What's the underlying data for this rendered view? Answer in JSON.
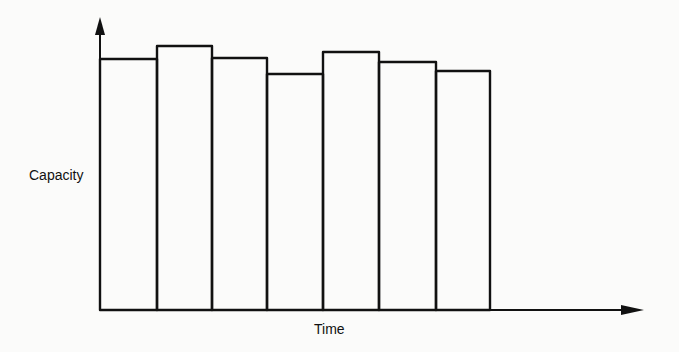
{
  "chart_data": {
    "type": "bar",
    "title": "",
    "xlabel": "Time",
    "ylabel": "Capacity",
    "categories": [
      "P1",
      "P2",
      "P3",
      "P4",
      "P5",
      "P6",
      "P7"
    ],
    "values": [
      251,
      264,
      252,
      236,
      258,
      248,
      239
    ],
    "value_units": "relative (pixel height above baseline, no scale shown)",
    "bar_edges_px": [
      100,
      157,
      212,
      267,
      323,
      379,
      436,
      490
    ],
    "bar_tops_px": [
      59,
      46,
      58,
      74,
      52,
      62,
      71
    ],
    "baseline_px": 310,
    "grid": false,
    "legend": null,
    "ticks": "none",
    "style": "outlined adjacent rectangles, black strokes on white"
  },
  "colors": {
    "stroke": "#111111",
    "background": "#fbfbfa"
  },
  "axes": {
    "x_label": "Time",
    "y_label": "Capacity"
  }
}
